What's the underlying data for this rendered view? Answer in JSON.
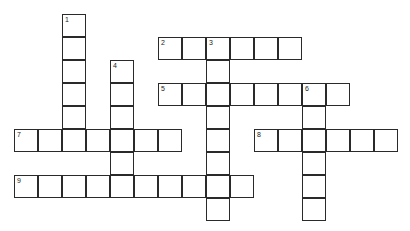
{
  "puzzle": {
    "cell_w": 24,
    "cell_h": 23,
    "origin_x": 14,
    "origin_y": 14,
    "border_color": "#2a2a2a",
    "entries": [
      {
        "number": "1",
        "direction": "down",
        "col": 2,
        "row": 0,
        "length": 6
      },
      {
        "number": "2",
        "direction": "across",
        "col": 6,
        "row": 1,
        "length": 6
      },
      {
        "number": "3",
        "direction": "down",
        "col": 8,
        "row": 1,
        "length": 8
      },
      {
        "number": "4",
        "direction": "down",
        "col": 4,
        "row": 2,
        "length": 6
      },
      {
        "number": "5",
        "direction": "across",
        "col": 6,
        "row": 3,
        "length": 8
      },
      {
        "number": "6",
        "direction": "down",
        "col": 12,
        "row": 3,
        "length": 6
      },
      {
        "number": "7",
        "direction": "across",
        "col": 0,
        "row": 5,
        "length": 7
      },
      {
        "number": "8",
        "direction": "across",
        "col": 10,
        "row": 5,
        "length": 6
      },
      {
        "number": "9",
        "direction": "across",
        "col": 0,
        "row": 7,
        "length": 10
      }
    ]
  }
}
